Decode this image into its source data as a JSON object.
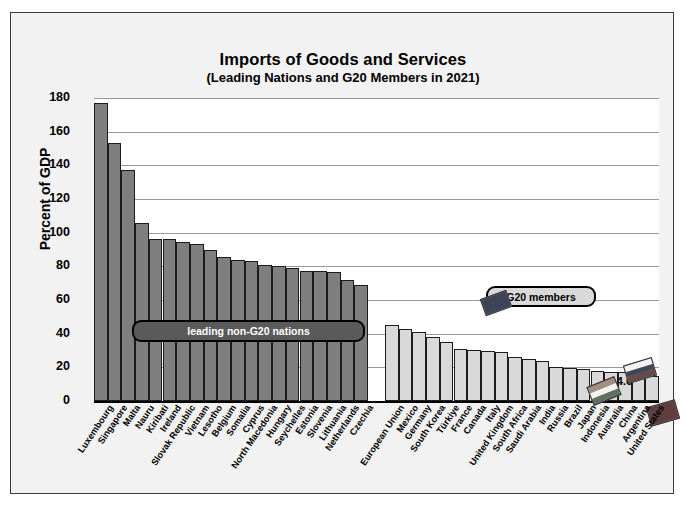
{
  "chart_data": {
    "type": "bar",
    "title": "Imports of Goods and Services",
    "subtitle": "(Leading Nations and G20 Members in 2021)",
    "xlabel": "",
    "ylabel": "Percent of GDP",
    "ylim": [
      0,
      180
    ],
    "ytick_step": 20,
    "yticks": [
      180,
      160,
      140,
      120,
      100,
      80,
      60,
      40,
      20,
      0
    ],
    "grid": true,
    "legend_position": "inside-plot",
    "series": [
      {
        "name": "leading non-G20 nations",
        "color": "#7f7f7f",
        "categories": [
          "Luxembourg",
          "Singapore",
          "Malta",
          "Nauru",
          "Kiribati",
          "Ireland",
          "Slovak Republic",
          "Vietnam",
          "Lesotho",
          "Belgium",
          "Somalia",
          "Cyprus",
          "North Macedonia",
          "Hungary",
          "Seychelles",
          "Estonia",
          "Slovenia",
          "Lithuania",
          "Netherlands",
          "Czechia"
        ],
        "values": [
          177.0,
          153.0,
          137.0,
          106.0,
          96.5,
          96.0,
          94.5,
          93.5,
          90.0,
          85.5,
          84.0,
          83.0,
          81.0,
          80.0,
          79.0,
          77.5,
          77.0,
          76.5,
          72.0,
          69.0
        ]
      },
      {
        "name": "G20 members",
        "color": "#d9d9d9",
        "categories": [
          "European Union",
          "Mexico",
          "Germany",
          "South Korea",
          "Türkiye",
          "France",
          "Canada",
          "Italy",
          "United Kingdom",
          "South Africa",
          "Saudi Arabia",
          "India",
          "Russia",
          "Brazil",
          "Japan",
          "Indonesia",
          "Australia",
          "China",
          "Argentina",
          "United States"
        ],
        "values": [
          45.0,
          42.5,
          41.0,
          38.0,
          35.0,
          31.0,
          30.5,
          30.0,
          29.0,
          26.0,
          25.0,
          24.0,
          20.5,
          19.5,
          19.0,
          18.0,
          17.5,
          17.0,
          16.5,
          14.6
        ]
      }
    ],
    "annotations": [
      {
        "text": "14.6",
        "refers_to": "United States",
        "value": 14.6
      }
    ]
  },
  "legends": {
    "non_g20_label": "leading non-G20 nations",
    "g20_label": "G20 members"
  },
  "flags": [
    {
      "name": "european-union-flag",
      "left": 388,
      "top": 196,
      "width": 28,
      "height": 18,
      "rotate": -20,
      "style": "eu"
    },
    {
      "name": "india-flag",
      "left": 495,
      "top": 283,
      "width": 30,
      "height": 20,
      "rotate": -22,
      "style": "india"
    },
    {
      "name": "russia-flag",
      "left": 531,
      "top": 263,
      "width": 30,
      "height": 19,
      "rotate": -17,
      "style": "russia"
    },
    {
      "name": "china-flag",
      "left": 554,
      "top": 305,
      "width": 30,
      "height": 20,
      "rotate": -16,
      "style": "china"
    },
    {
      "name": "united-states-flag",
      "left": 613,
      "top": 248,
      "width": 30,
      "height": 19,
      "rotate": -20,
      "style": "usa"
    }
  ],
  "source_note": ""
}
